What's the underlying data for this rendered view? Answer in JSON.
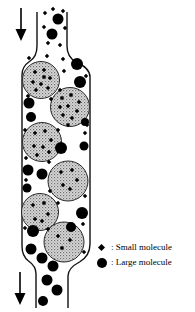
{
  "diagram": {
    "colors": {
      "ink": "#000000",
      "outline": "#111111",
      "bead_base": "#d9d9d9",
      "bead_dot_dark": "#6f6f6f",
      "bead_dot_mid": "#9a9a9a",
      "bead_stroke": "#2a2a2a"
    },
    "legend": {
      "items": [
        {
          "symbol": "small-molecule-diamond-icon",
          "label": ": Small molecule"
        },
        {
          "symbol": "large-molecule-circle-icon",
          "label": ": Large molecule"
        }
      ]
    },
    "arrows": [
      {
        "name": "inlet-flow-arrow",
        "x": 21,
        "y1": 8,
        "y2": 30,
        "head_w": 11,
        "head_h": 12
      },
      {
        "name": "outlet-flow-arrow",
        "x": 20,
        "y1": 272,
        "y2": 294,
        "head_w": 11,
        "head_h": 12
      }
    ],
    "beads": [
      {
        "cx": 41,
        "cy": 80,
        "r": 18.5
      },
      {
        "cx": 70,
        "cy": 107,
        "r": 19.5
      },
      {
        "cx": 42,
        "cy": 142,
        "r": 19.5
      },
      {
        "cx": 68,
        "cy": 181,
        "r": 20
      },
      {
        "cx": 40,
        "cy": 212,
        "r": 18.5
      },
      {
        "cx": 64,
        "cy": 242,
        "r": 20
      }
    ],
    "large_molecules": [
      [
        58,
        19,
        5.5
      ],
      [
        52,
        34,
        5.5
      ],
      [
        77,
        64,
        6
      ],
      [
        80,
        82,
        6
      ],
      [
        29,
        103,
        5.5
      ],
      [
        31,
        117,
        5
      ],
      [
        85,
        122,
        4
      ],
      [
        61,
        148,
        6
      ],
      [
        84,
        146,
        4.5
      ],
      [
        28,
        170,
        5.5
      ],
      [
        42,
        174,
        5.5
      ],
      [
        27,
        188,
        4.5
      ],
      [
        82,
        213,
        6
      ],
      [
        71,
        227,
        5
      ],
      [
        33,
        231,
        6
      ],
      [
        31,
        249,
        5.5
      ],
      [
        42,
        258,
        5.5
      ],
      [
        53,
        266,
        5.5
      ],
      [
        47,
        280,
        5.5
      ],
      [
        57,
        290,
        5.5
      ],
      [
        43,
        301,
        5
      ]
    ],
    "small_molecules": [
      [
        45,
        13
      ],
      [
        63,
        11
      ],
      [
        53,
        9
      ],
      [
        44,
        27
      ],
      [
        65,
        28
      ],
      [
        48,
        43
      ],
      [
        60,
        45
      ],
      [
        29,
        58
      ],
      [
        47,
        56
      ],
      [
        63,
        59
      ],
      [
        64,
        71
      ],
      [
        86,
        76
      ],
      [
        60,
        90
      ],
      [
        28,
        96
      ],
      [
        51,
        99
      ],
      [
        87,
        125
      ],
      [
        25,
        130
      ],
      [
        58,
        130
      ],
      [
        85,
        133
      ],
      [
        26,
        158
      ],
      [
        49,
        162
      ],
      [
        26,
        180
      ],
      [
        50,
        191
      ],
      [
        85,
        196
      ],
      [
        58,
        203
      ],
      [
        25,
        228
      ],
      [
        83,
        224
      ],
      [
        48,
        229
      ],
      [
        84,
        252
      ],
      [
        35,
        72
      ],
      [
        44,
        70
      ],
      [
        50,
        78
      ],
      [
        33,
        82
      ],
      [
        41,
        84
      ],
      [
        48,
        88
      ],
      [
        36,
        90
      ],
      [
        44,
        77
      ],
      [
        62,
        98
      ],
      [
        71,
        95
      ],
      [
        79,
        102
      ],
      [
        60,
        107
      ],
      [
        68,
        106
      ],
      [
        77,
        111
      ],
      [
        63,
        115
      ],
      [
        72,
        118
      ],
      [
        68,
        125
      ],
      [
        35,
        133
      ],
      [
        45,
        131
      ],
      [
        51,
        140
      ],
      [
        34,
        146
      ],
      [
        43,
        147
      ],
      [
        49,
        152
      ],
      [
        37,
        155
      ],
      [
        61,
        172
      ],
      [
        72,
        170
      ],
      [
        77,
        180
      ],
      [
        63,
        185
      ],
      [
        70,
        189
      ],
      [
        33,
        205
      ],
      [
        44,
        203
      ],
      [
        48,
        214
      ],
      [
        35,
        219
      ],
      [
        42,
        221
      ],
      [
        58,
        236
      ],
      [
        70,
        240
      ],
      [
        62,
        248
      ]
    ],
    "diamond_half_size": 2.2
  }
}
